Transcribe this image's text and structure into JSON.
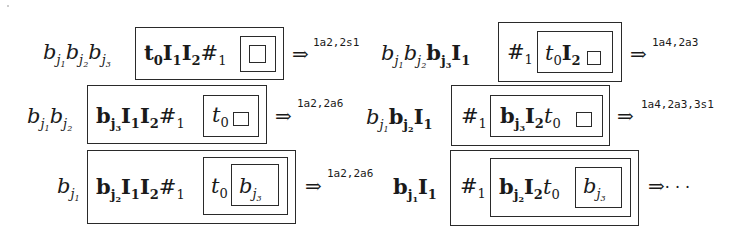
{
  "diagram": {
    "type": "nested-box derivation sequence",
    "steps": [
      {
        "id": "r1-left",
        "prefix": [
          {
            "sym": "b",
            "sub": "j1",
            "style": "italic"
          },
          {
            "sym": "b",
            "sub": "j2",
            "style": "italic"
          },
          {
            "sym": "b",
            "sub": "j3",
            "style": "italic"
          }
        ],
        "outer_box": "t0 I1 I2 #1",
        "inner_box": "",
        "innermost_box": "□",
        "arrow": "⇒",
        "label": "1a2,2s1"
      },
      {
        "id": "r1-right",
        "prefix": [
          {
            "sym": "b",
            "sub": "j1",
            "style": "italic"
          },
          {
            "sym": "b",
            "sub": "j2",
            "style": "italic"
          },
          {
            "sym": "b",
            "sub": "j3",
            "style": "bold"
          },
          {
            "sym": "I",
            "sub": "1",
            "style": "bold"
          }
        ],
        "outer_box": "#1",
        "inner_box": "t0 I2 □",
        "arrow": "⇒",
        "label": "1a4,2a3"
      },
      {
        "id": "r2-left",
        "prefix": [
          {
            "sym": "b",
            "sub": "j1",
            "style": "italic"
          },
          {
            "sym": "b",
            "sub": "j2",
            "style": "italic"
          }
        ],
        "outer_box": "bj3 I1 I2 #1",
        "inner_box": "t0 □",
        "arrow": "⇒",
        "label": "1a2,2a6"
      },
      {
        "id": "r2-right",
        "prefix": [
          {
            "sym": "b",
            "sub": "j1",
            "style": "italic"
          },
          {
            "sym": "b",
            "sub": "j2",
            "style": "bold"
          },
          {
            "sym": "I",
            "sub": "1",
            "style": "bold"
          }
        ],
        "outer_box": "#1",
        "inner_box": "bj3 I2 t0 □",
        "arrow": "⇒",
        "label": "1a4,2a3,3s1"
      },
      {
        "id": "r3-left",
        "prefix": [
          {
            "sym": "b",
            "sub": "j1",
            "style": "italic"
          }
        ],
        "outer_box": "bj2 I1 I2 #1",
        "inner_box": "t0",
        "innermost_box": "bj3",
        "arrow": "⇒",
        "label": "1a2,2a6"
      },
      {
        "id": "r3-right",
        "prefix": [
          {
            "sym": "b",
            "sub": "j1",
            "style": "bold"
          },
          {
            "sym": "I",
            "sub": "1",
            "style": "bold"
          }
        ],
        "outer_box": "#1",
        "inner_box": "bj2 I2 t0",
        "innermost_box": "bj3",
        "arrow": "⇒",
        "label": "⋯"
      }
    ]
  },
  "sym": {
    "b": "b",
    "t": "t",
    "I": "I",
    "hash": "#",
    "box": "□",
    "j1": "j",
    "j2": "j",
    "j3": "j",
    "n0": "0",
    "n1": "1",
    "n2": "2",
    "n3": "3",
    "arrow": "⇒",
    "ellipsis": "· · ·"
  },
  "labels": {
    "r1l": "1a2,2s1",
    "r1r": "1a4,2a3",
    "r2l": "1a2,2a6",
    "r2r": "1a4,2a3,3s1",
    "r3l": "1a2,2a6"
  }
}
